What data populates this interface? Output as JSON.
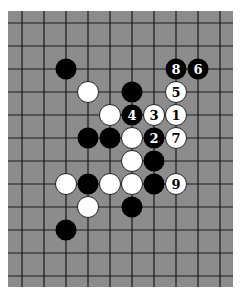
{
  "diagram": {
    "type": "go-board-fragment",
    "board": {
      "left": 8,
      "top": 11,
      "right": 233,
      "bottom": 287,
      "background": "#8c8c8c",
      "line_color": "#1a1a1a",
      "col_x": [
        22,
        44,
        66,
        88,
        110,
        132,
        154,
        176,
        198,
        220
      ],
      "row_y": [
        23,
        46,
        69,
        92,
        115,
        138,
        161,
        184,
        207,
        230,
        253,
        276
      ]
    },
    "stone_radius": 10.5,
    "colors": {
      "black": "#000000",
      "white": "#ffffff",
      "black_label": "#ffffff",
      "white_label": "#000000"
    },
    "stones": [
      {
        "color": "black",
        "col": 2,
        "row": 2,
        "label": ""
      },
      {
        "color": "black",
        "col": 7,
        "row": 2,
        "label": "8"
      },
      {
        "color": "black",
        "col": 8,
        "row": 2,
        "label": "6"
      },
      {
        "color": "white",
        "col": 3,
        "row": 3,
        "label": ""
      },
      {
        "color": "black",
        "col": 5,
        "row": 3,
        "label": ""
      },
      {
        "color": "white",
        "col": 7,
        "row": 3,
        "label": "5"
      },
      {
        "color": "white",
        "col": 4,
        "row": 4,
        "label": ""
      },
      {
        "color": "black",
        "col": 5,
        "row": 4,
        "label": "4"
      },
      {
        "color": "white",
        "col": 6,
        "row": 4,
        "label": "3"
      },
      {
        "color": "white",
        "col": 7,
        "row": 4,
        "label": "1"
      },
      {
        "color": "black",
        "col": 3,
        "row": 5,
        "label": ""
      },
      {
        "color": "black",
        "col": 4,
        "row": 5,
        "label": ""
      },
      {
        "color": "white",
        "col": 5,
        "row": 5,
        "label": ""
      },
      {
        "color": "black",
        "col": 6,
        "row": 5,
        "label": "2"
      },
      {
        "color": "white",
        "col": 7,
        "row": 5,
        "label": "7"
      },
      {
        "color": "white",
        "col": 5,
        "row": 6,
        "label": ""
      },
      {
        "color": "black",
        "col": 6,
        "row": 6,
        "label": ""
      },
      {
        "color": "white",
        "col": 2,
        "row": 7,
        "label": ""
      },
      {
        "color": "black",
        "col": 3,
        "row": 7,
        "label": ""
      },
      {
        "color": "white",
        "col": 4,
        "row": 7,
        "label": ""
      },
      {
        "color": "white",
        "col": 5,
        "row": 7,
        "label": ""
      },
      {
        "color": "black",
        "col": 6,
        "row": 7,
        "label": ""
      },
      {
        "color": "white",
        "col": 7,
        "row": 7,
        "label": "9"
      },
      {
        "color": "white",
        "col": 3,
        "row": 8,
        "label": ""
      },
      {
        "color": "black",
        "col": 5,
        "row": 8,
        "label": ""
      },
      {
        "color": "black",
        "col": 2,
        "row": 9,
        "label": ""
      }
    ]
  }
}
